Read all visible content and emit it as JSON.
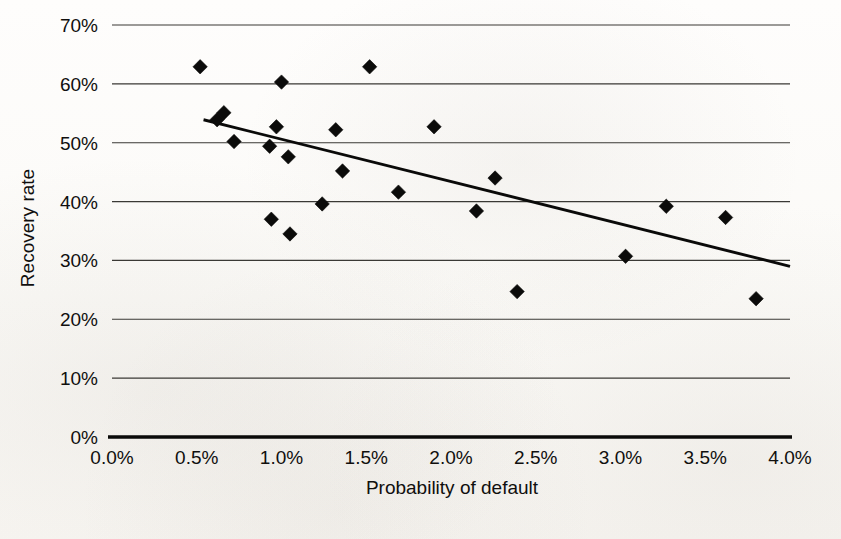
{
  "chart_data": {
    "type": "scatter",
    "title": "",
    "subtitle": "",
    "xlabel": "Probability of default",
    "ylabel": "Recovery rate",
    "xlim": [
      0.0,
      4.0
    ],
    "ylim": [
      0.0,
      70.0
    ],
    "x_tick_labels": [
      "0.0%",
      "0.5%",
      "1.0%",
      "1.5%",
      "2.0%",
      "2.5%",
      "3.0%",
      "3.5%",
      "4.0%"
    ],
    "x_tick_values": [
      0.0,
      0.5,
      1.0,
      1.5,
      2.0,
      2.5,
      3.0,
      3.5,
      4.0
    ],
    "y_tick_labels": [
      "0%",
      "10%",
      "20%",
      "30%",
      "40%",
      "50%",
      "60%",
      "70%"
    ],
    "y_tick_values": [
      0,
      10,
      20,
      30,
      40,
      50,
      60,
      70
    ],
    "grid": "horizontal",
    "legend": "none",
    "marker_shape": "diamond",
    "marker_color": "#0b0b0a",
    "axis_color": "#0a0a09",
    "gridline_color": "#3a3935",
    "background_color": "#fdfcfa",
    "points": [
      {
        "x": 0.52,
        "y": 62.9
      },
      {
        "x": 0.62,
        "y": 53.9
      },
      {
        "x": 0.66,
        "y": 55.1
      },
      {
        "x": 0.72,
        "y": 50.2
      },
      {
        "x": 0.93,
        "y": 49.4
      },
      {
        "x": 0.94,
        "y": 37.0
      },
      {
        "x": 0.97,
        "y": 52.7
      },
      {
        "x": 1.0,
        "y": 60.3
      },
      {
        "x": 1.04,
        "y": 47.6
      },
      {
        "x": 1.05,
        "y": 34.5
      },
      {
        "x": 1.24,
        "y": 39.6
      },
      {
        "x": 1.32,
        "y": 52.2
      },
      {
        "x": 1.36,
        "y": 45.2
      },
      {
        "x": 1.52,
        "y": 62.9
      },
      {
        "x": 1.69,
        "y": 41.6
      },
      {
        "x": 1.9,
        "y": 52.7
      },
      {
        "x": 2.15,
        "y": 38.4
      },
      {
        "x": 2.26,
        "y": 44.0
      },
      {
        "x": 2.39,
        "y": 24.7
      },
      {
        "x": 3.03,
        "y": 30.7
      },
      {
        "x": 3.27,
        "y": 39.2
      },
      {
        "x": 3.62,
        "y": 37.3
      },
      {
        "x": 3.8,
        "y": 23.5
      }
    ],
    "trendline": {
      "type": "linear",
      "x_start": 0.54,
      "y_start": 53.9,
      "x_end": 4.0,
      "y_end": 29.0
    }
  }
}
